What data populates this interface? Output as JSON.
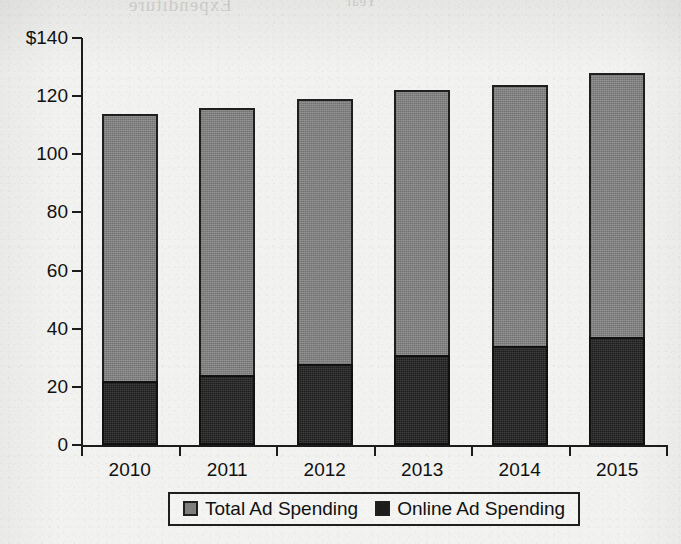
{
  "page": {
    "background_color": "#f2f2f0",
    "note_top_cropped_title": true
  },
  "ghost_marks": {
    "left": "Expenditure",
    "right": "Year"
  },
  "chart_data": {
    "type": "bar",
    "title": "",
    "subtitle": "",
    "xlabel": "",
    "ylabel": "",
    "categories": [
      "2010",
      "2011",
      "2012",
      "2013",
      "2014",
      "2015"
    ],
    "series": [
      {
        "name": "Total Ad Spending",
        "color": "#7f7f7f",
        "values": [
          114,
          116,
          119,
          122,
          124,
          128
        ]
      },
      {
        "name": "Online Ad Spending",
        "color": "#1d1d1d",
        "values": [
          22,
          24,
          28,
          31,
          34,
          37
        ]
      }
    ],
    "ylim": [
      0,
      140
    ],
    "yticks": [
      0,
      20,
      40,
      60,
      80,
      100,
      120,
      140
    ],
    "ytick_labels": [
      "0",
      "20",
      "40",
      "60",
      "80",
      "100",
      "120",
      "$140"
    ],
    "grid": false,
    "legend_position": "bottom-center",
    "bar_overlay": "online spending drawn over the base of the total bar"
  },
  "legend": {
    "entries": [
      {
        "label": "Total Ad Spending",
        "swatch": "total"
      },
      {
        "label": "Online Ad Spending",
        "swatch": "online"
      }
    ]
  }
}
